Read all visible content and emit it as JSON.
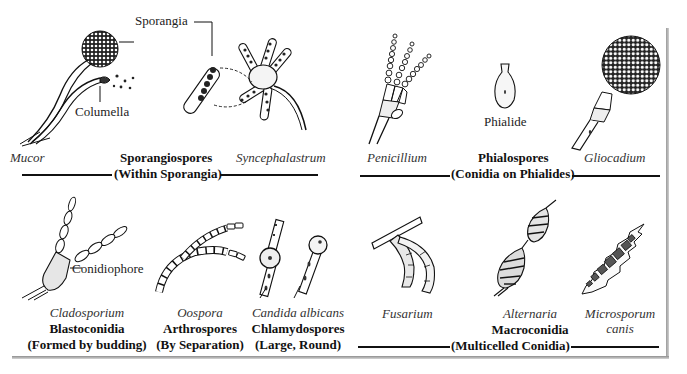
{
  "figure": {
    "panels": [
      {
        "id": "sporangiospores",
        "category_title": "Sporangiospores",
        "category_subtitle": "(Within Sporangia)",
        "examples": [
          "Mucor",
          "Syncephalastrum"
        ],
        "callouts": [
          "Sporangia",
          "Columella"
        ]
      },
      {
        "id": "phialospores",
        "category_title": "Phialospores",
        "category_subtitle": "(Conidia on Phialides)",
        "examples": [
          "Penicillium",
          "Gliocadium"
        ],
        "callouts": [
          "Phialide"
        ]
      },
      {
        "id": "blastoconidia",
        "category_title": "Blastoconidia",
        "category_subtitle": "(Formed by budding)",
        "examples": [
          "Cladosporium"
        ],
        "callouts": [
          "Conidiophore"
        ]
      },
      {
        "id": "arthrospores",
        "category_title": "Arthrospores",
        "category_subtitle": "(By Separation)",
        "examples": [
          "Oospora"
        ]
      },
      {
        "id": "chlamydospores",
        "category_title": "Chlamydospores",
        "category_subtitle": "(Large, Round)",
        "examples": [
          "Candida albicans"
        ]
      },
      {
        "id": "macroconidia",
        "category_title": "Macroconidia",
        "category_subtitle": "(Multicelled Conidia)",
        "examples": [
          "Fusarium",
          "Alternaria",
          "Microsporum",
          "canis"
        ]
      }
    ],
    "colors": {
      "ink": "#111111",
      "background": "#ffffff",
      "shadow": "#9a9a9a"
    }
  }
}
